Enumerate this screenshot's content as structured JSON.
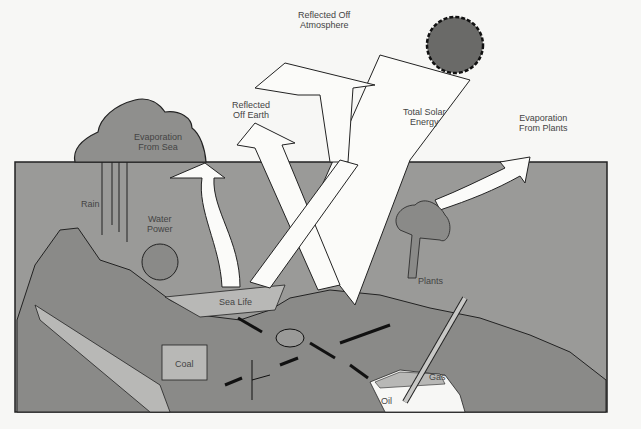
{
  "diagram": {
    "colors": {
      "background": "#f7f7f5",
      "ground_panel": "#9a9a98",
      "earth": "#8a8a88",
      "light_region": "#b8b8b6",
      "arrow_fill": "#fbfbf9",
      "outline": "#222222",
      "sun": "#6a6a68"
    },
    "labels": {
      "reflected_atmosphere": [
        "Reflected Off",
        "Atmosphere"
      ],
      "reflected_earth": [
        "Reflected",
        "Off Earth"
      ],
      "total_solar": [
        "Total Solar",
        "Energy"
      ],
      "evap_sea": [
        "Evaporation",
        "From Sea"
      ],
      "evap_plants": [
        "Evaporation",
        "From Plants"
      ],
      "rain": "Rain",
      "water_power": [
        "Water",
        "Power"
      ],
      "sea_life": "Sea Life",
      "plants": "Plants",
      "coal": "Coal",
      "gas": "Gas",
      "oil": "Oil"
    },
    "nodes": [
      {
        "id": "sun",
        "label": "Sun"
      },
      {
        "id": "total_solar",
        "label": "Total Solar Energy"
      },
      {
        "id": "reflected_atmosphere",
        "label": "Reflected Off Atmosphere"
      },
      {
        "id": "reflected_earth",
        "label": "Reflected Off Earth"
      },
      {
        "id": "evap_sea",
        "label": "Evaporation From Sea"
      },
      {
        "id": "evap_plants",
        "label": "Evaporation From Plants"
      },
      {
        "id": "rain",
        "label": "Rain"
      },
      {
        "id": "water_power",
        "label": "Water Power"
      },
      {
        "id": "sea_life",
        "label": "Sea Life"
      },
      {
        "id": "plants",
        "label": "Plants"
      },
      {
        "id": "coal",
        "label": "Coal"
      },
      {
        "id": "gas",
        "label": "Gas"
      },
      {
        "id": "oil",
        "label": "Oil"
      }
    ],
    "edges": [
      {
        "from": "sun",
        "to": "total_solar"
      },
      {
        "from": "total_solar",
        "to": "reflected_atmosphere"
      },
      {
        "from": "total_solar",
        "to": "reflected_earth"
      },
      {
        "from": "sea_life",
        "to": "evap_sea"
      },
      {
        "from": "plants",
        "to": "evap_plants"
      },
      {
        "from": "evap_sea",
        "to": "rain"
      },
      {
        "from": "rain",
        "to": "water_power"
      },
      {
        "from": "sea_life",
        "to": "oil"
      },
      {
        "from": "sea_life",
        "to": "gas"
      },
      {
        "from": "plants",
        "to": "coal"
      }
    ]
  }
}
